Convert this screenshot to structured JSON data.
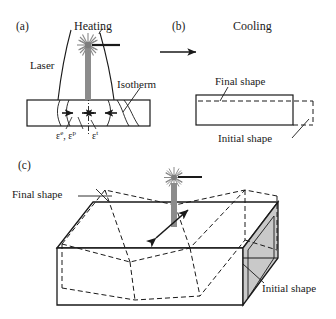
{
  "figure": {
    "panels": [
      {
        "tag": "(a)",
        "title": "Heating",
        "labels": {
          "laser": "Laser",
          "isotherm": "Isotherm",
          "strain_left": "ε",
          "strain_left_sup_e": "e",
          "strain_left_comma": ", ε",
          "strain_left_sup_p": "p",
          "strain_right": "ε",
          "strain_right_sup_t": "t"
        }
      },
      {
        "tag": "(b)",
        "title": "Cooling",
        "labels": {
          "final_shape": "Final shape",
          "initial_shape": "Initial shape"
        }
      },
      {
        "tag": "(c)",
        "title": "",
        "labels": {
          "final_shape": "Final shape",
          "initial_shape": "Initial shape"
        }
      }
    ],
    "icons": {
      "laser_spot": "starburst-icon",
      "laser_beam": "beam-icon",
      "process_arrow": "right-arrow-icon",
      "bend_arrow": "double-arrow-icon"
    },
    "colors": {
      "stroke": "#1a1a1a",
      "beam_gray": "#8c8c8c",
      "face_gray": "#c9c9c9",
      "background": "#ffffff"
    }
  }
}
